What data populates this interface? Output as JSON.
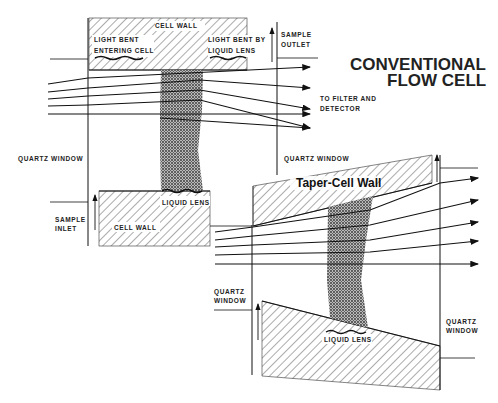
{
  "title": {
    "line1": "CONVENTIONAL",
    "line2": "FLOW CELL"
  },
  "conventional_cell": {
    "cell_wall_top": "CELL WALL",
    "light_bent_entering": {
      "line1": "LIGHT BENT",
      "line2": "ENTERING CELL"
    },
    "light_bent_lens": {
      "line1": "LIGHT BENT BY",
      "line2": "LIQUID LENS"
    },
    "sample_outlet": {
      "line1": "SAMPLE",
      "line2": "OUTLET"
    },
    "to_filter": {
      "line1": "TO FILTER AND",
      "line2": "DETECTOR"
    },
    "quartz_window_left": "QUARTZ WINDOW",
    "quartz_window_right": "QUARTZ WINDOW",
    "sample_inlet": {
      "line1": "SAMPLE",
      "line2": "INLET"
    },
    "cell_wall_bottom": "CELL WALL",
    "liquid_lens": "LIQUID LENS"
  },
  "taper_cell": {
    "wall_label": "Taper-Cell Wall",
    "quartz_window_left": {
      "line1": "QUARTZ",
      "line2": "WINDOW"
    },
    "quartz_window_right": {
      "line1": "QUARTZ",
      "line2": "WINDOW"
    },
    "liquid_lens": "LIQUID LENS"
  }
}
